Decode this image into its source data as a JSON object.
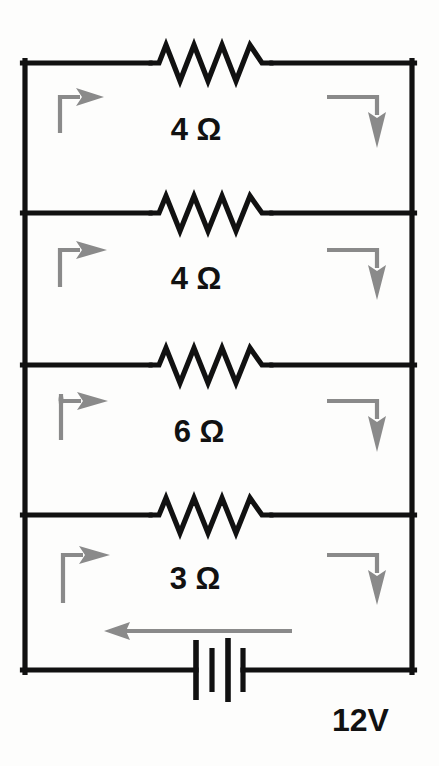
{
  "figure": {
    "type": "circuit-diagram",
    "background_color": "#fdfdfc",
    "wire_color": "#111111",
    "arrow_color": "#8a8a8a",
    "label_color": "#111111"
  },
  "branches": [
    {
      "id": "branch-1",
      "label": "4 Ω",
      "resistance_value": 4,
      "unit": "Ω",
      "resistor_peaks": 4
    },
    {
      "id": "branch-2",
      "label": "4 Ω",
      "resistance_value": 4,
      "unit": "Ω",
      "resistor_peaks": 4
    },
    {
      "id": "branch-3",
      "label": "6 Ω",
      "resistance_value": 6,
      "unit": "Ω",
      "resistor_peaks": 4
    },
    {
      "id": "branch-4",
      "label": "3 Ω",
      "resistance_value": 3,
      "unit": "Ω",
      "resistor_peaks": 4
    }
  ],
  "source": {
    "label": "12V",
    "voltage_value": 12,
    "unit": "V",
    "symbol": "battery",
    "plate_count": 4
  },
  "current_arrows": {
    "left_rail_direction": "right",
    "right_rail_direction": "down",
    "battery_branch_direction": "left",
    "count_left": 4,
    "count_right": 4,
    "count_main": 1
  }
}
